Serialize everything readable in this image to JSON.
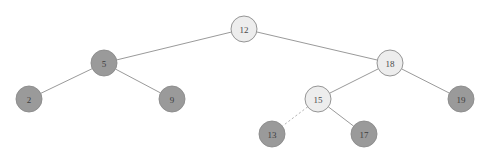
{
  "figure": {
    "kind": "binary-search-tree-diagram",
    "background_color": "#ffffff",
    "width": 490,
    "height": 160
  },
  "style": {
    "node_fill_light": "#ededed",
    "node_fill_dark": "#9a9a9a",
    "node_stroke": "#8a8a8a",
    "edge_color": "#9a9a9a",
    "dashed_edge_color": "#b4b4b4",
    "label_color": "#4a4a4a",
    "node_radius": 13
  },
  "chart_data": {
    "type": "diagram",
    "title": "",
    "nodes": [
      {
        "id": "n12",
        "label": "12",
        "x": 244,
        "y": 29,
        "r": 13,
        "fill": "light",
        "depth": 0
      },
      {
        "id": "n5",
        "label": "5",
        "x": 104,
        "y": 63,
        "r": 13,
        "fill": "dark",
        "depth": 1
      },
      {
        "id": "n18",
        "label": "18",
        "x": 390,
        "y": 63,
        "r": 13,
        "fill": "light",
        "depth": 1
      },
      {
        "id": "n2",
        "label": "2",
        "x": 29,
        "y": 99,
        "r": 13,
        "fill": "dark",
        "depth": 2
      },
      {
        "id": "n9",
        "label": "9",
        "x": 172,
        "y": 99,
        "r": 13,
        "fill": "dark",
        "depth": 2
      },
      {
        "id": "n15",
        "label": "15",
        "x": 318,
        "y": 99,
        "r": 13,
        "fill": "light",
        "depth": 2
      },
      {
        "id": "n19",
        "label": "19",
        "x": 461,
        "y": 99,
        "r": 13,
        "fill": "dark",
        "depth": 2
      },
      {
        "id": "n13",
        "label": "13",
        "x": 272,
        "y": 134,
        "r": 13,
        "fill": "dark",
        "depth": 3
      },
      {
        "id": "n17",
        "label": "17",
        "x": 364,
        "y": 134,
        "r": 13,
        "fill": "dark",
        "depth": 3
      }
    ],
    "edges": [
      {
        "from": "n12",
        "to": "n5",
        "style": "solid"
      },
      {
        "from": "n12",
        "to": "n18",
        "style": "solid"
      },
      {
        "from": "n5",
        "to": "n2",
        "style": "solid"
      },
      {
        "from": "n5",
        "to": "n9",
        "style": "solid"
      },
      {
        "from": "n18",
        "to": "n15",
        "style": "solid"
      },
      {
        "from": "n18",
        "to": "n19",
        "style": "solid"
      },
      {
        "from": "n15",
        "to": "n13",
        "style": "dashed"
      },
      {
        "from": "n15",
        "to": "n17",
        "style": "solid"
      }
    ]
  }
}
